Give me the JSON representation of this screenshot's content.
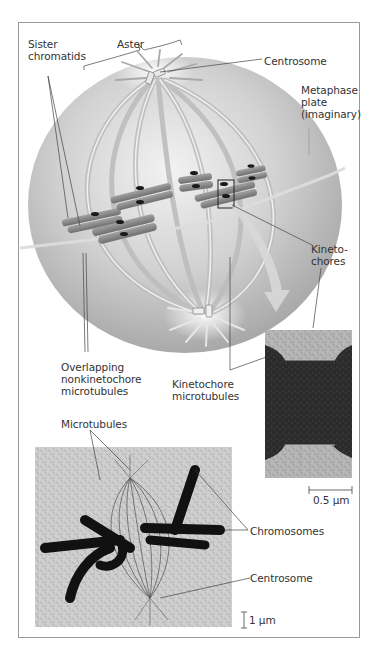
{
  "figure": {
    "top_diagram": {
      "labels": {
        "sister_chromatids": "Sister\nchromatids",
        "aster": "Aster",
        "centrosome_top": "Centrosome",
        "metaphase_plate": "Metaphase\nplate\n(imaginary)",
        "kinetochores": "Kineto-\nchores",
        "overlapping_nonkinetochore": "Overlapping\nnonkinetochore\nmicrotubules",
        "kinetochore_microtubules": "Kinetochore\nmicrotubules"
      }
    },
    "em_inset": {
      "scale_bar_label": "0.5 µm"
    },
    "light_micrograph": {
      "labels": {
        "microtubules": "Microtubules",
        "chromosomes": "Chromosomes",
        "centrosome_bottom": "Centrosome"
      },
      "scale_bar_label": "1 µm"
    },
    "colors": {
      "sphere": "#c9c9c9",
      "sphere_shadow": "#a7a7a7",
      "chromosome": "#8a8a8a",
      "plate": "#d8d8d8",
      "arrow": "#d2d2d2",
      "frame": "#9a9a9a",
      "label_text": "#333333"
    }
  }
}
